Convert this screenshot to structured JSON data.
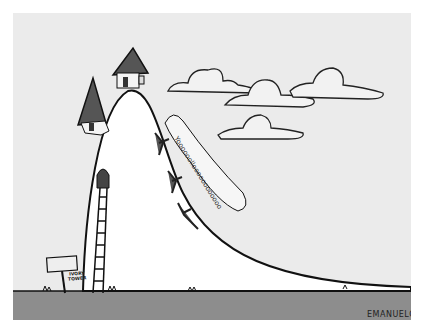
{
  "illustration": {
    "title": "Ivory Tower cartoon",
    "sign": {
      "text": "IVORY TOWER"
    },
    "speech_bubble": {
      "text": "Yoooooolloooooooooooo"
    },
    "signature": {
      "text": "EMANUELCO"
    },
    "colors": {
      "sky": "#ebebeb",
      "ground": "#8d8d8d",
      "hill": "#ffffff",
      "outline": "#111111",
      "roof": "#555555",
      "cloud": "#f2f2f2"
    }
  }
}
